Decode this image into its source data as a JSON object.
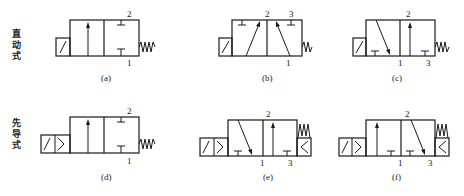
{
  "row_labels": {
    "direct": [
      "直",
      "动",
      "式"
    ],
    "pilot": [
      "先",
      "导",
      "式"
    ]
  },
  "valves": {
    "a": {
      "caption": "(a)",
      "port_top": "2",
      "port_bottom": "1"
    },
    "b": {
      "caption": "(b)",
      "port_top_left": "2",
      "port_top_right": "3",
      "port_bottom": "1"
    },
    "c": {
      "caption": "(c)",
      "port_top": "2",
      "port_bottom_left": "1",
      "port_bottom_right": "3"
    },
    "d": {
      "caption": "(d)",
      "port_top": "2",
      "port_bottom": "1"
    },
    "e": {
      "caption": "(e)",
      "port_top": "2",
      "port_bottom_left": "1",
      "port_bottom_right": "3"
    },
    "f": {
      "caption": "(f)",
      "port_top": "2",
      "port_bottom_left": "1",
      "port_bottom_right": "3"
    }
  }
}
